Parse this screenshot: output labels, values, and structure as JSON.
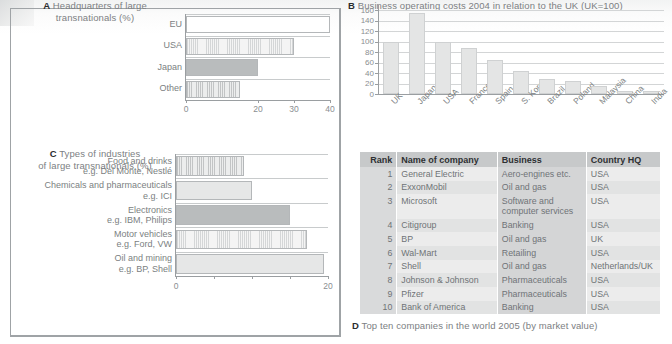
{
  "chart_data": [
    {
      "id": "A",
      "type": "bar",
      "orientation": "horizontal",
      "title": "Headquarters of large transnationals (%)",
      "caption_letter": "A",
      "caption_line1": "Headquarters of large",
      "caption_line2": "transnationals (%)",
      "categories": [
        "EU",
        "USA",
        "Japan",
        "Other"
      ],
      "values": [
        40,
        30,
        20,
        15
      ],
      "fills": [
        "white",
        "vhatch-light",
        "solid-mid",
        "vhatch-mid"
      ],
      "xlabel": "",
      "ylabel": "",
      "xticks": [
        0,
        20,
        30,
        40
      ],
      "xticklabels": [
        "0",
        "20",
        "30",
        "40"
      ],
      "xlim": [
        0,
        40
      ],
      "grid": true
    },
    {
      "id": "B",
      "type": "bar",
      "orientation": "vertical",
      "title": "Business operating costs 2004 in relation to the UK (UK=100)",
      "caption_letter": "B",
      "caption_text": "Business operating costs 2004 in relation to the UK (UK=100)",
      "categories": [
        "UK",
        "Japan",
        "USA",
        "France",
        "Spain",
        "S. Korea",
        "Brazil",
        "Poland",
        "Malaysia",
        "China",
        "India"
      ],
      "values": [
        100,
        155,
        100,
        88,
        65,
        43,
        28,
        25,
        15,
        6,
        5
      ],
      "ylim": [
        0,
        160
      ],
      "yticks": [
        0,
        20,
        40,
        60,
        80,
        100,
        120,
        140,
        160
      ],
      "yticklabels": [
        "0",
        "20",
        "40",
        "60",
        "80",
        "100",
        "120",
        "140",
        "160"
      ],
      "xlabel": "",
      "ylabel": "",
      "grid": true
    },
    {
      "id": "C",
      "type": "bar",
      "orientation": "horizontal",
      "title": "Types of industries of large transnationals (%)",
      "caption_letter": "C",
      "caption_line1": "Types of industries",
      "caption_line2": "of large transnationals (%)",
      "categories": [
        "Food and drinks\ne.g. Del Monte, Nestlé",
        "Chemicals and pharmaceuticals\ne.g. ICI",
        "Electronics\ne.g. IBM, Philips",
        "Motor vehicles\ne.g. Ford, VW",
        "Oil and mining\ne.g. BP, Shell"
      ],
      "category_lines": [
        [
          "Food and drinks",
          "e.g. Del Monte, Nestlé"
        ],
        [
          "Chemicals and pharmaceuticals",
          "e.g. ICI"
        ],
        [
          "Electronics",
          "e.g. IBM, Philips"
        ],
        [
          "Motor vehicles",
          "e.g. Ford, VW"
        ],
        [
          "Oil and mining",
          "e.g. BP, Shell"
        ]
      ],
      "values": [
        9.0,
        10.0,
        15.0,
        17.3,
        19.5
      ],
      "fills": [
        "vhatch-mid",
        "solid-light",
        "solid-mid",
        "vhatch-light",
        "solid-light"
      ],
      "xticks": [
        0,
        5,
        10,
        15,
        20
      ],
      "xticklabels": [
        "0",
        "",
        "",
        "",
        "20"
      ],
      "xlim": [
        0,
        20
      ],
      "grid": true
    },
    {
      "id": "D",
      "type": "table",
      "title": "Top ten companies in the world 2005 (by market value)",
      "caption_letter": "D",
      "caption_text": "Top ten companies in the world 2005 (by market value)",
      "columns": [
        "Rank",
        "Name of company",
        "Business",
        "Country HQ"
      ],
      "rows": [
        [
          "1",
          "General Electric",
          "Aero-engines etc.",
          "USA"
        ],
        [
          "2",
          "ExxonMobil",
          "Oil and gas",
          "USA"
        ],
        [
          "3",
          "Microsoft",
          "Software and computer services",
          "USA"
        ],
        [
          "4",
          "Citigroup",
          "Banking",
          "USA"
        ],
        [
          "5",
          "BP",
          "Oil and gas",
          "UK"
        ],
        [
          "6",
          "Wal-Mart",
          "Retailing",
          "USA"
        ],
        [
          "7",
          "Shell",
          "Oil and gas",
          "Netherlands/UK"
        ],
        [
          "8",
          "Johnson & Johnson",
          "Pharmaceuticals",
          "USA"
        ],
        [
          "9",
          "Pfizer",
          "Pharmaceuticals",
          "USA"
        ],
        [
          "10",
          "Bank of America",
          "Banking",
          "USA"
        ]
      ]
    }
  ],
  "colors": {
    "ink": "#6f7376",
    "ink_dark": "#2b2d2f",
    "rule": "#9fa3a6",
    "grid": "#c8cbcc",
    "bar_light": "#e6e7e7",
    "bar_mid": "#b9bcbd",
    "table_header": "#c7c9ca",
    "table_row_odd": "#ececec",
    "table_row_even": "#e2e3e3"
  }
}
